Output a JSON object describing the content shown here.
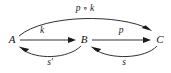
{
  "diagram": {
    "type": "commutative-diagram",
    "background_color": "#ffffff",
    "stroke_color": "#1a1a1a",
    "text_color": "#111111",
    "objects": [
      {
        "id": "A",
        "label": "A",
        "x": 12,
        "y": 40
      },
      {
        "id": "B",
        "label": "B",
        "x": 84,
        "y": 40
      },
      {
        "id": "C",
        "label": "C",
        "x": 160,
        "y": 40
      }
    ],
    "morphisms": [
      {
        "id": "k",
        "label": "k",
        "from": "A",
        "to": "B",
        "shape": "straight",
        "label_x": 42,
        "label_y": 31
      },
      {
        "id": "p",
        "label": "p",
        "from": "B",
        "to": "C",
        "shape": "straight",
        "label_x": 121,
        "label_y": 31
      },
      {
        "id": "pk",
        "label": "p ∘ k",
        "from": "A",
        "to": "C",
        "shape": "arc-above",
        "label_x": 85,
        "label_y": 9
      },
      {
        "id": "s-prime",
        "label": "s'",
        "from": "B",
        "to": "A",
        "shape": "arc-below",
        "label_x": 50,
        "label_y": 63
      },
      {
        "id": "s",
        "label": "s",
        "from": "C",
        "to": "B",
        "shape": "arc-below",
        "label_x": 124,
        "label_y": 63
      }
    ]
  }
}
